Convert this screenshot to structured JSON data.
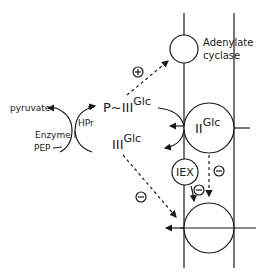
{
  "diagram": {
    "labels": {
      "adenylate_cyclase_line1": "Adenylate",
      "adenylate_cyclase_line2": "cyclase",
      "pyruvate": "pyruvate",
      "hpr": "HPr",
      "enzyme_i": "Enzyme I",
      "pep": "PEP",
      "p_iii_glc_base": "P~III",
      "p_iii_glc_sup": "Glc",
      "iii_glc_base": "III",
      "iii_glc_sup": "Glc",
      "ii_glc_base": "II",
      "ii_glc_sup": "Glc",
      "iex": "IEX"
    },
    "regulation_signs": {
      "activation": "+",
      "inhibition_iii_to_lower": "−",
      "inhibition_iex": "−",
      "inhibition_ii": "−"
    },
    "colors": {
      "stroke": "#1a1a1a",
      "background": "#ffffff"
    }
  }
}
